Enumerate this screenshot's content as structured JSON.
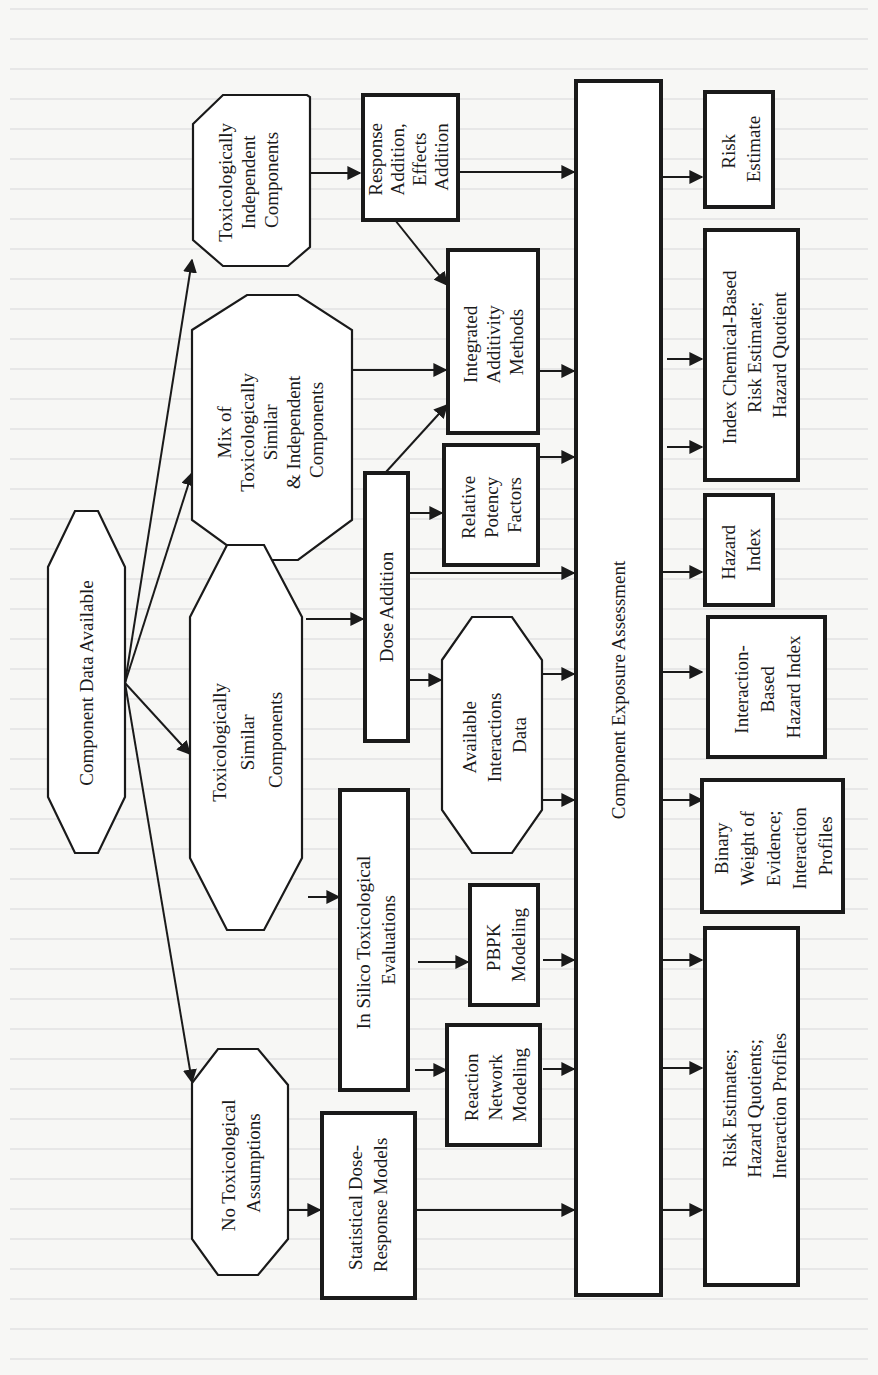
{
  "diagram": {
    "orientation": "rotated-90-ccw",
    "nodes": {
      "component_data": {
        "lines": [
          "Component Data Available"
        ],
        "shape": "octagon"
      },
      "tox_independent": {
        "lines": [
          "Toxicologically",
          "Independent",
          "Components"
        ],
        "shape": "octagon"
      },
      "mix": {
        "lines": [
          "Mix of",
          "Toxicologically",
          "Similar",
          "& Independent",
          "Components"
        ],
        "shape": "octagon"
      },
      "tox_similar": {
        "lines": [
          "Toxicologically",
          "Similar",
          "Components"
        ],
        "shape": "octagon"
      },
      "no_assumptions": {
        "lines": [
          "No Toxicological",
          "Assumptions"
        ],
        "shape": "octagon"
      },
      "response_addition": {
        "lines": [
          "Response",
          "Addition,",
          "Effects",
          "Addition"
        ],
        "shape": "box"
      },
      "integrated_additivity": {
        "lines": [
          "Integrated",
          "Additivity",
          "Methods"
        ],
        "shape": "box"
      },
      "relative_potency": {
        "lines": [
          "Relative",
          "Potency",
          "Factors"
        ],
        "shape": "box"
      },
      "dose_addition": {
        "lines": [
          "Dose Addition"
        ],
        "shape": "box"
      },
      "available_interactions": {
        "lines": [
          "Available",
          "Interactions",
          "Data"
        ],
        "shape": "octagon"
      },
      "in_silico": {
        "lines": [
          "In Silico Toxicological",
          "Evaluations"
        ],
        "shape": "box"
      },
      "pbpk": {
        "lines": [
          "PBPK",
          "Modeling"
        ],
        "shape": "box"
      },
      "reaction_network": {
        "lines": [
          "Reaction",
          "Network",
          "Modeling"
        ],
        "shape": "box"
      },
      "statistical_dr": {
        "lines": [
          "Statistical Dose-",
          "Response Models"
        ],
        "shape": "box"
      },
      "exposure_assessment": {
        "lines": [
          "Component Exposure Assessment"
        ],
        "shape": "box"
      },
      "risk_estimate": {
        "lines": [
          "Risk",
          "Estimate"
        ],
        "shape": "box"
      },
      "index_chemical": {
        "lines": [
          "Index Chemical-Based",
          "Risk Estimate;",
          "Hazard Quotient"
        ],
        "shape": "box"
      },
      "hazard_index": {
        "lines": [
          "Hazard",
          "Index"
        ],
        "shape": "box"
      },
      "interaction_hi": {
        "lines": [
          "Interaction-",
          "Based",
          "Hazard Index"
        ],
        "shape": "box"
      },
      "binary_woe": {
        "lines": [
          "Binary",
          "Weight of",
          "Evidence;",
          "Interaction",
          "Profiles"
        ],
        "shape": "box"
      },
      "risk_estimates_hq": {
        "lines": [
          "Risk Estimates;",
          "Hazard Quotients;",
          "Interaction Profiles"
        ],
        "shape": "box"
      }
    },
    "edges": [
      [
        "component_data",
        "tox_independent"
      ],
      [
        "component_data",
        "mix"
      ],
      [
        "component_data",
        "tox_similar"
      ],
      [
        "component_data",
        "no_assumptions"
      ],
      [
        "tox_independent",
        "response_addition"
      ],
      [
        "response_addition",
        "integrated_additivity"
      ],
      [
        "response_addition",
        "exposure_assessment"
      ],
      [
        "mix",
        "integrated_additivity"
      ],
      [
        "dose_addition",
        "integrated_additivity"
      ],
      [
        "tox_similar",
        "dose_addition"
      ],
      [
        "tox_similar",
        "in_silico"
      ],
      [
        "dose_addition",
        "relative_potency"
      ],
      [
        "dose_addition",
        "exposure_assessment"
      ],
      [
        "dose_addition",
        "available_interactions"
      ],
      [
        "in_silico",
        "pbpk"
      ],
      [
        "in_silico",
        "reaction_network"
      ],
      [
        "no_assumptions",
        "statistical_dr"
      ],
      [
        "integrated_additivity",
        "exposure_assessment"
      ],
      [
        "relative_potency",
        "exposure_assessment"
      ],
      [
        "available_interactions",
        "exposure_assessment"
      ],
      [
        "pbpk",
        "exposure_assessment"
      ],
      [
        "reaction_network",
        "exposure_assessment"
      ],
      [
        "statistical_dr",
        "exposure_assessment"
      ],
      [
        "exposure_assessment",
        "risk_estimate"
      ],
      [
        "exposure_assessment",
        "index_chemical"
      ],
      [
        "exposure_assessment",
        "hazard_index"
      ],
      [
        "exposure_assessment",
        "interaction_hi"
      ],
      [
        "exposure_assessment",
        "binary_woe"
      ],
      [
        "exposure_assessment",
        "risk_estimates_hq"
      ]
    ]
  },
  "colors": {
    "ink": "#1a1a1a",
    "page": "#f7f7f5",
    "fill": "#ffffff",
    "bleed_text": "#dadada"
  }
}
